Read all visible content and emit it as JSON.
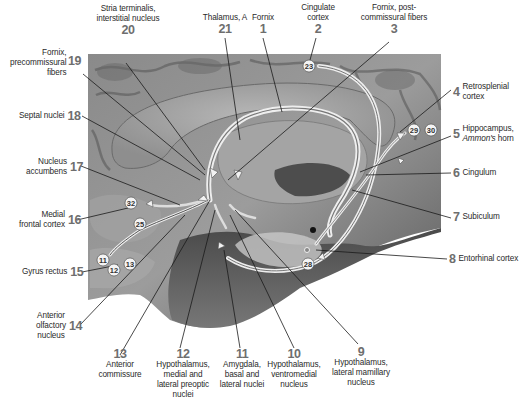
{
  "diagram": {
    "labels": [
      {
        "num": "1",
        "text": "Fornix"
      },
      {
        "num": "2",
        "text": "Cingulate cortex"
      },
      {
        "num": "3",
        "text": "Fornix, post-commissural fibers"
      },
      {
        "num": "4",
        "text": "Retrosplenial cortex"
      },
      {
        "num": "5",
        "text": "Hippocampus,",
        "text2": "Ammon's",
        "text3": "horn"
      },
      {
        "num": "6",
        "text": "Cingulum"
      },
      {
        "num": "7",
        "text": "Subiculum"
      },
      {
        "num": "8",
        "text": "Entorhinal cortex"
      },
      {
        "num": "9",
        "text": "Hypothalamus, lateral mamillary nucleus"
      },
      {
        "num": "10",
        "text": "Hypothalamus, ventromedial nucleus"
      },
      {
        "num": "11",
        "text": "Amygdala, basal and lateral nuclei"
      },
      {
        "num": "12",
        "text": "Hypothalamus, medial and lateral preoptic nuclei"
      },
      {
        "num": "13",
        "text": "Anterior commissure"
      },
      {
        "num": "14",
        "text": "Anterior olfactory nucleus"
      },
      {
        "num": "15",
        "text": "Gyrus rectus"
      },
      {
        "num": "16",
        "text": "Medial frontal cortex"
      },
      {
        "num": "17",
        "text": "Nucleus accumbens"
      },
      {
        "num": "18",
        "text": "Septal nuclei"
      },
      {
        "num": "19",
        "text": "Fornix, precommissural fibers"
      },
      {
        "num": "20",
        "text": "Stria terminalis, interstitial nucleus"
      },
      {
        "num": "21",
        "text": "Thalamus, A"
      }
    ],
    "lines": {
      "l2": [
        "Cingulate",
        "cortex"
      ],
      "l3": [
        "Fornix, post-",
        "commissural fibers"
      ],
      "l4": [
        "Retrosplenial",
        "cortex"
      ],
      "l9": [
        "Hypothalamus,",
        "lateral mamillary",
        "nucleus"
      ],
      "l10": [
        "Hypothalamus,",
        "ventromedial",
        "nucleus"
      ],
      "l11": [
        "Amygdala,",
        "basal and",
        "lateral nuclei"
      ],
      "l12": [
        "Hypothalamus,",
        "medial and",
        "lateral preoptic",
        "nuclei"
      ],
      "l13": [
        "Anterior",
        "commissure"
      ],
      "l14": [
        "Anterior",
        "olfactory",
        "nucleus"
      ],
      "l16": [
        "Medial",
        "frontal cortex"
      ],
      "l17": [
        "Nucleus",
        "accumbens"
      ],
      "l19": [
        "Fornix,",
        "precommissural",
        "fibers"
      ],
      "l20": [
        "Stria terminalis,",
        "interstitial nucleus"
      ]
    },
    "area_markers": [
      "23",
      "29",
      "30",
      "32",
      "25",
      "11",
      "12",
      "13",
      "28"
    ]
  }
}
